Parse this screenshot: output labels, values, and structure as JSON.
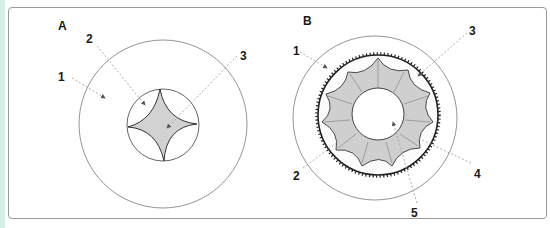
{
  "figure": {
    "panel_a": {
      "label": "A",
      "callouts": [
        "1",
        "2",
        "3"
      ]
    },
    "panel_b": {
      "label": "B",
      "callouts": [
        "1",
        "2",
        "3",
        "4",
        "5"
      ]
    }
  },
  "colors": {
    "frame_border": "#9a9a9a",
    "left_strip": "#d8ece8",
    "line": "#444444",
    "leader": "#9a9a9a"
  }
}
